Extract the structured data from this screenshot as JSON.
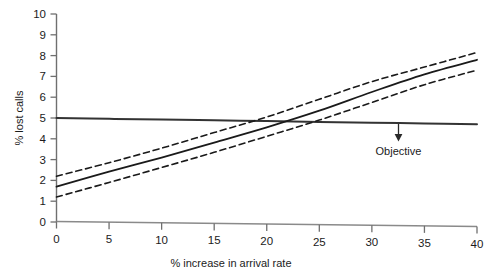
{
  "chart_data": {
    "type": "line",
    "title": "",
    "subtitle": "",
    "xlabel": "% increase in arrival rate",
    "ylabel": "% lost calls",
    "xlim": [
      0,
      40
    ],
    "ylim": [
      0,
      10
    ],
    "xticks": [
      0,
      5,
      10,
      15,
      20,
      25,
      30,
      35,
      40
    ],
    "xtick_labels": [
      "0",
      "5",
      "10",
      "15",
      "20",
      "25",
      "30",
      "35",
      "40"
    ],
    "yticks": [
      0,
      1,
      2,
      3,
      4,
      5,
      6,
      7,
      8,
      9,
      10
    ],
    "ytick_labels": [
      "0",
      "1",
      "2",
      "3",
      "4",
      "5",
      "6",
      "7",
      "8",
      "9",
      "10"
    ],
    "grid": false,
    "legend": "none",
    "x": [
      0,
      5,
      10,
      15,
      20,
      25,
      30,
      35,
      40
    ],
    "series": [
      {
        "name": "Objective",
        "style": "solid",
        "linewidth": 2.0,
        "color": "#333333",
        "values": [
          5.0,
          4.96,
          4.93,
          4.89,
          4.85,
          4.81,
          4.77,
          4.74,
          4.7
        ]
      },
      {
        "name": "Upper confidence bound",
        "style": "dashed",
        "linewidth": 1.6,
        "color": "#1a1a1a",
        "values": [
          2.2,
          2.85,
          3.55,
          4.3,
          5.05,
          5.9,
          6.75,
          7.45,
          8.15
        ]
      },
      {
        "name": "Predicted lost calls",
        "style": "solid",
        "linewidth": 1.8,
        "color": "#1a1a1a",
        "values": [
          1.7,
          2.42,
          3.1,
          3.82,
          4.55,
          5.35,
          6.25,
          7.1,
          7.8
        ]
      },
      {
        "name": "Lower confidence bound",
        "style": "dashed",
        "linewidth": 1.6,
        "color": "#1a1a1a",
        "values": [
          1.2,
          1.9,
          2.62,
          3.35,
          4.12,
          4.9,
          5.75,
          6.6,
          7.3
        ]
      }
    ],
    "annotations": [
      {
        "text": "Objective",
        "x": 33.5,
        "y": 5.0,
        "arrow": "down",
        "arrow_from_y": 4.74,
        "arrow_to_y": 4.05
      }
    ]
  },
  "axis": {
    "y_title": "% lost calls",
    "x_title": "% increase in arrival rate"
  },
  "annotation": {
    "objective_label": "Objective"
  },
  "colors": {
    "ink": "#1a1a1a",
    "axis": "#6f6f6f",
    "background": "#ffffff"
  }
}
